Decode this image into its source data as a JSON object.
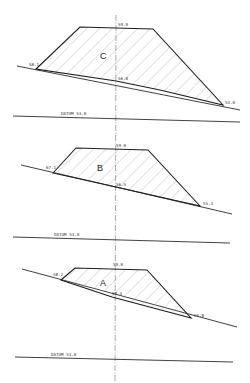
{
  "diagram": {
    "type": "earthwork-cross-sections",
    "colors": {
      "line": "#1e1e1e",
      "hatch": "#9a9a9a",
      "background": "#ffffff"
    },
    "sections": [
      {
        "id": "C",
        "label": "C",
        "formation_level": "59.0",
        "centre_ground_level": "56.0",
        "left_ground_level": "58.1",
        "right_ground_level": "54.0",
        "datum": "DATUM 53.0"
      },
      {
        "id": "B",
        "label": "B",
        "formation_level": "59.0",
        "centre_ground_level": "56.5",
        "left_ground_level": "67.1",
        "right_ground_level": "55.4",
        "datum": "DATUM 53.0"
      },
      {
        "id": "A",
        "label": "A",
        "formation_level": "59.0",
        "centre_ground_level": "58.4",
        "left_ground_level": "58.2",
        "right_ground_level": "55.8",
        "datum": "DATUM 53.0"
      }
    ]
  }
}
